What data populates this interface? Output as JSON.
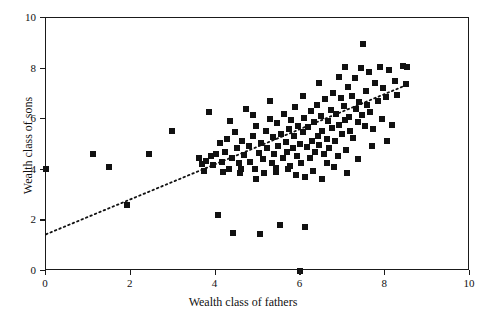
{
  "chart_data": {
    "type": "scatter",
    "title": "",
    "xlabel": "Wealth class of fathers",
    "ylabel": "Wealth class of sons",
    "xlim": [
      0,
      10
    ],
    "ylim": [
      0,
      10
    ],
    "xticks": [
      0,
      2,
      4,
      6,
      8,
      10
    ],
    "yticks": [
      0,
      2,
      4,
      6,
      8,
      10
    ],
    "xtick_labels": [
      "0",
      "2",
      "4",
      "6",
      "8",
      "10"
    ],
    "ytick_labels": [
      "0",
      "2",
      "4",
      "6",
      "8",
      "10"
    ],
    "grid": false,
    "legend": false,
    "marker": {
      "shape": "square",
      "color": "#111111",
      "size_px": 6
    },
    "trendline": {
      "style": "dotted",
      "color": "#111111",
      "x_start": 0.0,
      "y_start": 1.45,
      "x_end": 8.5,
      "y_end": 7.35
    },
    "points": [
      [
        0.0,
        4.05
      ],
      [
        1.12,
        4.62
      ],
      [
        1.48,
        4.12
      ],
      [
        1.92,
        2.6
      ],
      [
        2.42,
        4.62
      ],
      [
        2.98,
        5.55
      ],
      [
        3.62,
        4.48
      ],
      [
        3.68,
        4.22
      ],
      [
        3.72,
        3.95
      ],
      [
        3.78,
        4.35
      ],
      [
        3.85,
        6.28
      ],
      [
        3.88,
        4.55
      ],
      [
        3.95,
        4.18
      ],
      [
        4.02,
        4.62
      ],
      [
        4.05,
        2.22
      ],
      [
        4.1,
        5.05
      ],
      [
        4.15,
        4.3
      ],
      [
        4.18,
        3.92
      ],
      [
        4.22,
        4.7
      ],
      [
        4.28,
        5.22
      ],
      [
        4.32,
        4.05
      ],
      [
        4.38,
        4.48
      ],
      [
        4.42,
        1.52
      ],
      [
        4.45,
        5.48
      ],
      [
        4.5,
        4.85
      ],
      [
        4.55,
        4.25
      ],
      [
        4.58,
        3.88
      ],
      [
        4.62,
        5.12
      ],
      [
        4.68,
        4.58
      ],
      [
        4.72,
        6.42
      ],
      [
        4.78,
        4.95
      ],
      [
        4.82,
        4.32
      ],
      [
        4.88,
        5.35
      ],
      [
        4.92,
        4.05
      ],
      [
        4.95,
        5.72
      ],
      [
        5.02,
        4.68
      ],
      [
        5.05,
        1.48
      ],
      [
        5.08,
        5.05
      ],
      [
        5.12,
        4.42
      ],
      [
        5.18,
        5.52
      ],
      [
        5.22,
        4.88
      ],
      [
        5.28,
        6.02
      ],
      [
        5.32,
        4.25
      ],
      [
        5.35,
        5.28
      ],
      [
        5.38,
        4.62
      ],
      [
        5.42,
        3.92
      ],
      [
        5.45,
        5.85
      ],
      [
        5.48,
        4.95
      ],
      [
        5.52,
        1.82
      ],
      [
        5.55,
        5.42
      ],
      [
        5.58,
        4.48
      ],
      [
        5.62,
        6.22
      ],
      [
        5.65,
        5.08
      ],
      [
        5.68,
        4.72
      ],
      [
        5.72,
        5.62
      ],
      [
        5.75,
        4.15
      ],
      [
        5.78,
        5.95
      ],
      [
        5.82,
        4.88
      ],
      [
        5.85,
        5.32
      ],
      [
        5.88,
        6.48
      ],
      [
        5.92,
        4.55
      ],
      [
        5.95,
        5.75
      ],
      [
        5.98,
        5.02
      ],
      [
        6.0,
        0.0
      ],
      [
        6.02,
        4.28
      ],
      [
        6.05,
        5.48
      ],
      [
        6.08,
        6.05
      ],
      [
        6.12,
        1.72
      ],
      [
        6.15,
        4.92
      ],
      [
        6.18,
        5.68
      ],
      [
        6.22,
        4.45
      ],
      [
        6.25,
        6.32
      ],
      [
        6.28,
        5.15
      ],
      [
        6.32,
        5.88
      ],
      [
        6.35,
        4.72
      ],
      [
        6.38,
        6.58
      ],
      [
        6.42,
        5.35
      ],
      [
        6.45,
        4.98
      ],
      [
        6.48,
        6.12
      ],
      [
        6.52,
        5.55
      ],
      [
        6.55,
        4.62
      ],
      [
        6.58,
        6.78
      ],
      [
        6.62,
        5.22
      ],
      [
        6.65,
        5.92
      ],
      [
        6.68,
        4.85
      ],
      [
        6.72,
        6.38
      ],
      [
        6.75,
        5.65
      ],
      [
        6.78,
        7.02
      ],
      [
        6.82,
        5.12
      ],
      [
        6.85,
        6.22
      ],
      [
        6.88,
        4.55
      ],
      [
        6.92,
        5.78
      ],
      [
        6.95,
        6.85
      ],
      [
        6.98,
        5.42
      ],
      [
        7.02,
        6.52
      ],
      [
        7.05,
        5.98
      ],
      [
        7.08,
        4.78
      ],
      [
        7.12,
        7.28
      ],
      [
        7.15,
        6.08
      ],
      [
        7.18,
        5.52
      ],
      [
        7.22,
        6.92
      ],
      [
        7.25,
        5.25
      ],
      [
        7.28,
        7.62
      ],
      [
        7.32,
        6.42
      ],
      [
        7.35,
        5.88
      ],
      [
        7.38,
        6.68
      ],
      [
        7.42,
        8.02
      ],
      [
        7.45,
        6.15
      ],
      [
        7.48,
        8.98
      ],
      [
        7.52,
        5.72
      ],
      [
        7.55,
        7.12
      ],
      [
        7.58,
        6.58
      ],
      [
        7.62,
        7.85
      ],
      [
        7.65,
        6.28
      ],
      [
        7.72,
        5.62
      ],
      [
        7.75,
        7.42
      ],
      [
        7.82,
        6.72
      ],
      [
        7.88,
        8.05
      ],
      [
        7.92,
        6.02
      ],
      [
        7.95,
        7.22
      ],
      [
        8.02,
        6.88
      ],
      [
        8.08,
        7.95
      ],
      [
        8.15,
        5.78
      ],
      [
        8.22,
        7.52
      ],
      [
        8.28,
        6.95
      ],
      [
        8.42,
        8.12
      ],
      [
        8.48,
        7.38
      ],
      [
        8.52,
        8.08
      ],
      [
        4.6,
        4.05
      ],
      [
        5.15,
        3.88
      ],
      [
        5.7,
        4.05
      ],
      [
        6.1,
        3.72
      ],
      [
        6.3,
        3.95
      ],
      [
        6.8,
        4.12
      ],
      [
        7.1,
        3.88
      ],
      [
        6.5,
        3.65
      ],
      [
        5.9,
        3.78
      ],
      [
        4.95,
        3.62
      ],
      [
        5.42,
        4.08
      ],
      [
        6.62,
        4.28
      ],
      [
        7.35,
        4.42
      ],
      [
        7.68,
        4.95
      ],
      [
        8.05,
        5.15
      ],
      [
        4.35,
        5.92
      ],
      [
        4.88,
        6.15
      ],
      [
        5.28,
        6.72
      ],
      [
        6.05,
        6.92
      ],
      [
        6.45,
        7.42
      ],
      [
        6.92,
        7.68
      ],
      [
        7.05,
        8.05
      ]
    ]
  }
}
